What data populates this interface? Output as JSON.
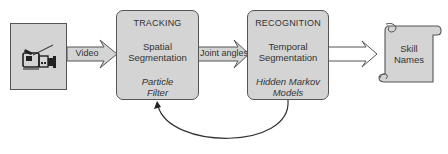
{
  "diagram": {
    "source": {
      "icon": "video-camera-icon"
    },
    "edges": [
      {
        "from": "source",
        "to": "tracking",
        "label": "Video"
      },
      {
        "from": "tracking",
        "to": "recognition",
        "label": "Joint angles"
      },
      {
        "from": "recognition",
        "to": "output",
        "label": ""
      },
      {
        "from": "recognition",
        "to": "tracking",
        "label": "",
        "type": "feedback"
      }
    ],
    "tracking": {
      "title": "TRACKING",
      "subtitle_line1": "Spatial",
      "subtitle_line2": "Segmentation",
      "method_line1": "Particle",
      "method_line2": "Filter"
    },
    "recognition": {
      "title": "RECOGNITION",
      "subtitle_line1": "Temporal",
      "subtitle_line2": "Segmentation",
      "method_line1": "Hidden Markov",
      "method_line2": "Models"
    },
    "output": {
      "shape": "scroll",
      "line1": "Skill",
      "line2": "Names"
    }
  },
  "colors": {
    "box_fill": "#d4d4d4",
    "stroke": "#555555"
  }
}
